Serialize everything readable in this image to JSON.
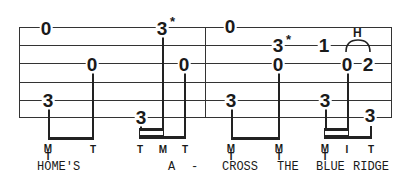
{
  "tablature": {
    "strings": 6,
    "notes": {
      "m1_n1": "0",
      "m1_n2": "3",
      "m1_n3": "0",
      "m1_n4": "3",
      "m1_n5": "3",
      "m1_n6": "0",
      "m2_n1": "0",
      "m2_n2": "3",
      "m2_n3": "3",
      "m2_n4": "0",
      "m2_n5": "1",
      "m2_n6": "3",
      "m2_n7": "0",
      "m2_n8": "2",
      "m2_n9": "3"
    },
    "star": "*",
    "hammer_on": "H",
    "fingerings": {
      "f1_top": "M",
      "f1_bot": "T",
      "f2": "T",
      "f3": "T",
      "f4": "M",
      "f5": "T",
      "f6_top": "M",
      "f6_bot": "T",
      "f7_top": "M",
      "f7_bot": "T",
      "f8_top": "M",
      "f8_bot": "T",
      "f9": "I",
      "f10": "T"
    },
    "lyrics": {
      "w1": "HOME'S",
      "w2": "A",
      "w3": "-",
      "w4": "CROSS",
      "w5": "THE",
      "w6": "BLUE",
      "w7": "RIDGE"
    }
  }
}
